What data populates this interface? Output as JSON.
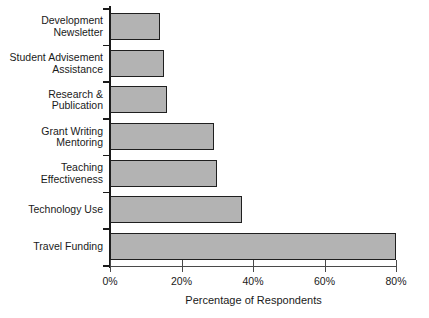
{
  "chart_data": {
    "type": "bar",
    "orientation": "horizontal",
    "title": "",
    "xlabel": "Percentage of Respondents",
    "ylabel": "",
    "xlim": [
      0,
      80
    ],
    "xticks": [
      "0%",
      "20%",
      "40%",
      "60%",
      "80%"
    ],
    "xtick_values": [
      0,
      20,
      40,
      60,
      80
    ],
    "grid": false,
    "legend": null,
    "categories": [
      "Development\nNewsletter",
      "Student Advisement\nAssistance",
      "Research &\nPublication",
      "Grant Writing\nMentoring",
      "Teaching\nEffectiveness",
      "Technology Use",
      "Travel Funding"
    ],
    "values": [
      14,
      15,
      16,
      29,
      30,
      37,
      80
    ],
    "bar_fill_color": "#b3b3b3",
    "bar_edge_color": "#1f1f1f",
    "axis_color": "#1a1a1a"
  }
}
